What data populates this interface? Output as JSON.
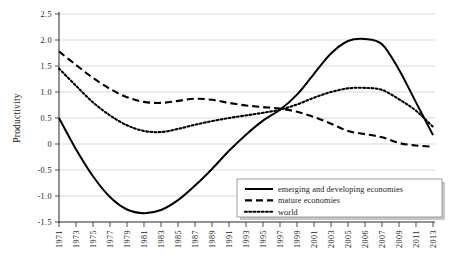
{
  "chart_data": {
    "type": "line",
    "title": "",
    "xlabel": "",
    "ylabel": "Productivity",
    "ylim": [
      -1.5,
      2.5
    ],
    "yticks": [
      "2.5",
      "2.0",
      "1.5",
      "1.0",
      "0.5",
      "0",
      "-0.5",
      "-1.0",
      "-1.5"
    ],
    "ytick_values": [
      2.5,
      2.0,
      1.5,
      1.0,
      0.5,
      0,
      -0.5,
      -1.0,
      -1.5
    ],
    "grid": true,
    "legend_position": "bottom-right",
    "categories": [
      "1971",
      "1973",
      "1975",
      "1977",
      "1979",
      "1981",
      "1983",
      "1985",
      "1987",
      "1989",
      "1991",
      "1993",
      "1995",
      "1997",
      "1999",
      "2001",
      "2003",
      "2005",
      "2006",
      "2007",
      "2009",
      "2011",
      "2013"
    ],
    "x": [
      1971,
      1973,
      1975,
      1977,
      1979,
      1981,
      1983,
      1985,
      1987,
      1989,
      1991,
      1993,
      1995,
      1997,
      1999,
      2001,
      2003,
      2005,
      2006,
      2007,
      2009,
      2011,
      2013
    ],
    "series": [
      {
        "name": "emerging and developing economies",
        "style": "solid",
        "color": "#000000",
        "values": [
          0.5,
          -0.1,
          -0.62,
          -1.02,
          -1.26,
          -1.33,
          -1.27,
          -1.08,
          -0.8,
          -0.48,
          -0.13,
          0.18,
          0.45,
          0.66,
          0.95,
          1.35,
          1.74,
          1.98,
          2.02,
          1.92,
          1.43,
          0.8,
          0.17
        ]
      },
      {
        "name": "mature economies",
        "style": "dashed",
        "color": "#000000",
        "values": [
          1.78,
          1.52,
          1.27,
          1.06,
          0.9,
          0.81,
          0.79,
          0.83,
          0.87,
          0.85,
          0.79,
          0.74,
          0.71,
          0.68,
          0.62,
          0.52,
          0.39,
          0.25,
          0.19,
          0.13,
          0.02,
          -0.03,
          -0.05
        ]
      },
      {
        "name": "world",
        "style": "dotted",
        "color": "#000000",
        "values": [
          1.45,
          1.12,
          0.8,
          0.55,
          0.36,
          0.25,
          0.23,
          0.29,
          0.37,
          0.44,
          0.5,
          0.55,
          0.6,
          0.66,
          0.76,
          0.89,
          1.0,
          1.07,
          1.08,
          1.04,
          0.86,
          0.64,
          0.33
        ]
      }
    ]
  },
  "legend": {
    "items": [
      {
        "label": "emerging and developing economies",
        "style": "solid"
      },
      {
        "label": "mature economies",
        "style": "dashed"
      },
      {
        "label": "world",
        "style": "dotted"
      }
    ]
  }
}
